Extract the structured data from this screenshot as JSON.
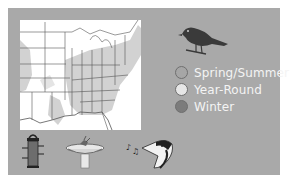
{
  "range_map": {
    "region": "Eastern United States",
    "colors": {
      "panel_bg": "#a9a9a9",
      "map_bg": "#ffffff",
      "range_fill": "#d2d2d2",
      "state_lines": "#555555"
    }
  },
  "bird_silhouette": {
    "icon": "perched-bird-icon",
    "color": "#3a3a3a"
  },
  "legend": {
    "items": [
      {
        "label": "Spring/Summer",
        "color": "#a6a6a6"
      },
      {
        "label": "Year-Round",
        "color": "#e6e6e6"
      },
      {
        "label": "Winter",
        "color": "#7c7c7c"
      }
    ]
  },
  "attributes": [
    {
      "icon": "tube-feeder-icon"
    },
    {
      "icon": "birdbath-icon"
    },
    {
      "icon": "song-notes-bird-head-icon"
    }
  ]
}
